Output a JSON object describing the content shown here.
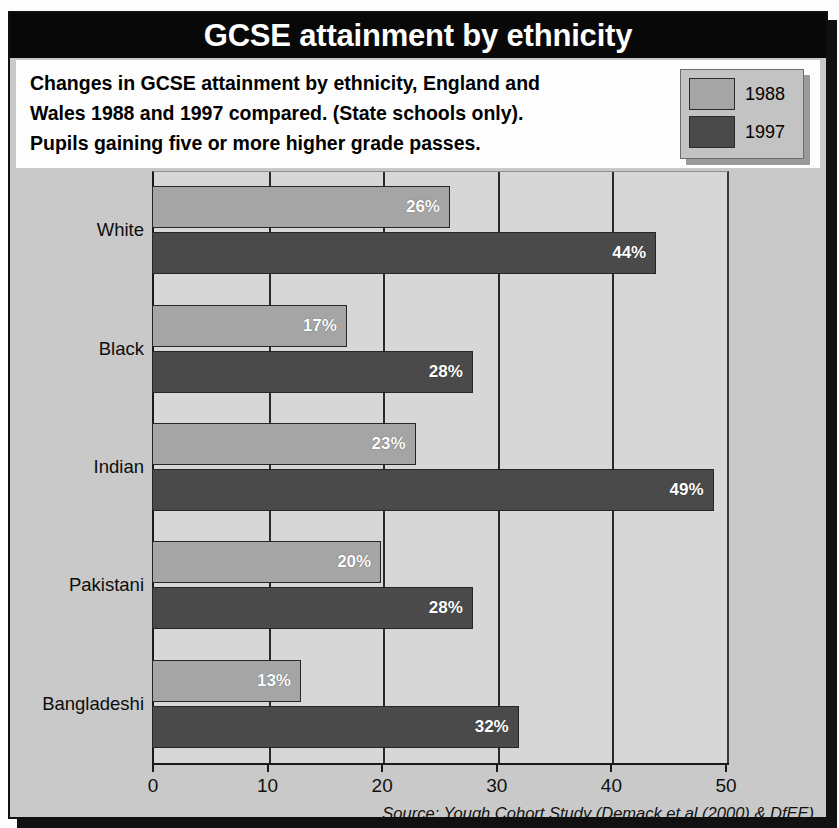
{
  "figure": {
    "title": "GCSE attainment by ethnicity",
    "caption_lines": [
      "Changes in GCSE attainment by ethnicity, England and",
      "Wales 1988 and 1997 compared. (State schools only).",
      "Pupils gaining five or more higher grade passes."
    ],
    "source": "Source: Yough Cohort Study (Demack et al (2000) & DfEE)"
  },
  "legend": {
    "items": [
      {
        "label": "1988",
        "color": "#a5a5a5"
      },
      {
        "label": "1997",
        "color": "#4a4a4a"
      }
    ]
  },
  "colors": {
    "series_1988": "#a5a5a5",
    "series_1997": "#4a4a4a",
    "plot_background": "#d7d7d7",
    "frame_background": "#c9c9c9",
    "title_background": "#080808",
    "title_text": "#ffffff"
  },
  "chart_data": {
    "type": "bar",
    "orientation": "horizontal",
    "title": "GCSE attainment by ethnicity",
    "subtitle": "Changes in GCSE attainment by ethnicity, England and Wales 1988 and 1997 compared. (State schools only). Pupils gaining five or more higher grade passes.",
    "xlabel": "",
    "ylabel": "",
    "xlim": [
      0,
      50
    ],
    "xticks": [
      0,
      10,
      20,
      30,
      40,
      50
    ],
    "xtick_labels": [
      "0",
      "10",
      "20",
      "30",
      "40",
      "50"
    ],
    "grid": true,
    "legend_position": "top-right",
    "categories": [
      "White",
      "Black",
      "Indian",
      "Pakistani",
      "Bangladeshi"
    ],
    "series": [
      {
        "name": "1988",
        "color": "#a5a5a5",
        "values": [
          26,
          17,
          23,
          20,
          13
        ],
        "data_labels": [
          "26%",
          "17%",
          "23%",
          "20%",
          "13%"
        ]
      },
      {
        "name": "1997",
        "color": "#4a4a4a",
        "values": [
          44,
          28,
          49,
          28,
          32
        ],
        "data_labels": [
          "44%",
          "28%",
          "49%",
          "28%",
          "32%"
        ]
      }
    ]
  }
}
